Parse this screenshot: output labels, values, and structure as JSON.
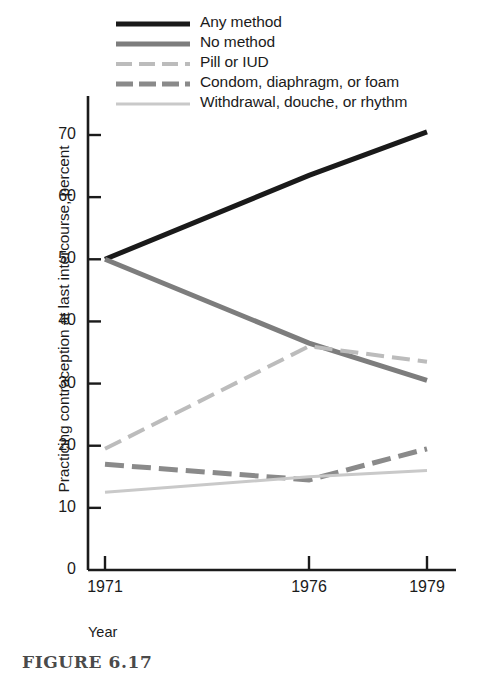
{
  "figure": {
    "caption": "FIGURE 6.17",
    "x_axis_title": "Year",
    "y_axis_title": "Practicing contraception at last intercourse, percent"
  },
  "colors": {
    "any_method": "#1a1a1a",
    "no_method": "#7d7d7d",
    "pill_or_iud": "#bcbcbc",
    "condom": "#8a8a8a",
    "withdrawal": "#c9c9c9",
    "axis": "#1b1b1b",
    "caption": "#4a4a4a"
  },
  "chart_data": {
    "type": "line",
    "title": "",
    "xlabel": "Year",
    "ylabel": "Practicing contraception at last intercourse, percent",
    "x": [
      1971,
      1976,
      1979
    ],
    "xtick_labels": [
      "1971",
      "1976",
      "1979"
    ],
    "ytick_labels": [
      "0",
      "10",
      "20",
      "30",
      "40",
      "50",
      "60",
      "70"
    ],
    "ytick_values": [
      0,
      10,
      20,
      30,
      40,
      50,
      60,
      70
    ],
    "xlim": [
      1970.1,
      1981.2
    ],
    "ylim": [
      0,
      76
    ],
    "grid": false,
    "legend_position": "top-center",
    "series": [
      {
        "name": "Any method",
        "values": [
          50,
          63.5,
          70.5
        ],
        "color": "#1a1a1a",
        "style": "solid",
        "width": 5
      },
      {
        "name": "No method",
        "values": [
          50,
          36.5,
          30.5
        ],
        "color": "#7d7d7d",
        "style": "solid",
        "width": 5
      },
      {
        "name": "Pill or IUD",
        "values": [
          19.5,
          36,
          33.5
        ],
        "color": "#bcbcbc",
        "style": "dashed",
        "width": 4
      },
      {
        "name": "Condom, diaphragm, or foam",
        "values": [
          17,
          14.5,
          19.5
        ],
        "color": "#8a8a8a",
        "style": "dashed",
        "width": 5
      },
      {
        "name": "Withdrawal, douche, or rhythm",
        "values": [
          12.5,
          15,
          16
        ],
        "color": "#c9c9c9",
        "style": "solid",
        "width": 3
      }
    ]
  },
  "legend": {
    "items": [
      {
        "label": "Any method"
      },
      {
        "label": "No method"
      },
      {
        "label": "Pill or IUD"
      },
      {
        "label": "Condom, diaphragm, or foam"
      },
      {
        "label": "Withdrawal, douche, or rhythm"
      }
    ]
  },
  "y_ticks": [
    {
      "label": "70"
    },
    {
      "label": "60"
    },
    {
      "label": "50"
    },
    {
      "label": "40"
    },
    {
      "label": "30"
    },
    {
      "label": "20"
    },
    {
      "label": "10"
    },
    {
      "label": "0"
    }
  ],
  "x_ticks": [
    {
      "label": "1971"
    },
    {
      "label": "1976"
    },
    {
      "label": "1979"
    }
  ]
}
